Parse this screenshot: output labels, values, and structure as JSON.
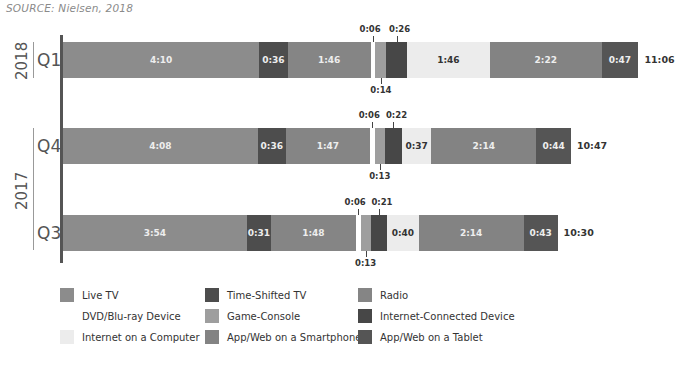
{
  "source": "SOURCE: Nielsen, 2018",
  "colors": {
    "live_tv": "#8c8c8c",
    "time_shifted_tv": "#4d4d4d",
    "radio": "#858585",
    "dvd": "#ffffff",
    "game_console": "#9e9e9e",
    "internet_connected": "#474747",
    "internet_computer": "#ececec",
    "smartphone": "#838383",
    "tablet": "#555555",
    "axis": "#555555"
  },
  "legend": [
    {
      "key": "live_tv",
      "label": "Live TV"
    },
    {
      "key": "time_shifted_tv",
      "label": "Time-Shifted TV"
    },
    {
      "key": "radio",
      "label": "Radio"
    },
    {
      "key": "dvd",
      "label": "DVD/Blu-ray Device"
    },
    {
      "key": "game_console",
      "label": "Game-Console"
    },
    {
      "key": "internet_connected",
      "label": "Internet-Connected Device"
    },
    {
      "key": "internet_computer",
      "label": "Internet on a Computer"
    },
    {
      "key": "smartphone",
      "label": "App/Web on a Smartphone"
    },
    {
      "key": "tablet",
      "label": "App/Web on a Tablet"
    }
  ],
  "rows": [
    {
      "year": "2018",
      "quarter": "Q1",
      "total": "11:06",
      "labels": [
        "4:10",
        "0:36",
        "1:46",
        "0:06",
        "0:14",
        "0:26",
        "1:46",
        "2:22",
        "0:47"
      ]
    },
    {
      "year": "2017",
      "quarter": "Q4",
      "total": "10:47",
      "labels": [
        "4:08",
        "0:36",
        "1:47",
        "0:06",
        "0:13",
        "0:22",
        "0:37",
        "2:14",
        "0:44"
      ]
    },
    {
      "year": "2017",
      "quarter": "Q3",
      "total": "10:30",
      "labels": [
        "3:54",
        "0:31",
        "1:48",
        "0:06",
        "0:13",
        "0:21",
        "0:40",
        "2:14",
        "0:43"
      ]
    }
  ],
  "chart_data": {
    "type": "bar",
    "orientation": "horizontal",
    "stacked": true,
    "title": "",
    "source": "SOURCE: Nielsen, 2018",
    "xlabel": "",
    "ylabel": "",
    "unit": "minutes per day (displayed as h:mm)",
    "categories": [
      "2018 Q1",
      "2017 Q4",
      "2017 Q3"
    ],
    "year_groups": [
      {
        "year": "2018",
        "quarters": [
          "Q1"
        ]
      },
      {
        "year": "2017",
        "quarters": [
          "Q4",
          "Q3"
        ]
      }
    ],
    "series": [
      {
        "name": "Live TV",
        "values": [
          250,
          248,
          234
        ],
        "labels": [
          "4:10",
          "4:08",
          "3:54"
        ]
      },
      {
        "name": "Time-Shifted TV",
        "values": [
          36,
          36,
          31
        ],
        "labels": [
          "0:36",
          "0:36",
          "0:31"
        ]
      },
      {
        "name": "Radio",
        "values": [
          106,
          107,
          108
        ],
        "labels": [
          "1:46",
          "1:47",
          "1:48"
        ]
      },
      {
        "name": "DVD/Blu-ray Device",
        "values": [
          6,
          6,
          6
        ],
        "labels": [
          "0:06",
          "0:06",
          "0:06"
        ]
      },
      {
        "name": "Game-Console",
        "values": [
          14,
          13,
          13
        ],
        "labels": [
          "0:14",
          "0:13",
          "0:13"
        ]
      },
      {
        "name": "Internet-Connected Device",
        "values": [
          26,
          22,
          21
        ],
        "labels": [
          "0:26",
          "0:22",
          "0:21"
        ]
      },
      {
        "name": "Internet on a Computer",
        "values": [
          106,
          37,
          40
        ],
        "labels": [
          "1:46",
          "0:37",
          "0:40"
        ]
      },
      {
        "name": "App/Web on a Smartphone",
        "values": [
          142,
          134,
          134
        ],
        "labels": [
          "2:22",
          "2:14",
          "2:14"
        ]
      },
      {
        "name": "App/Web on a Tablet",
        "values": [
          47,
          44,
          43
        ],
        "labels": [
          "0:47",
          "0:44",
          "0:43"
        ]
      }
    ],
    "totals": [
      {
        "category": "2018 Q1",
        "label": "11:06",
        "minutes": 666
      },
      {
        "category": "2017 Q4",
        "label": "10:47",
        "minutes": 647
      },
      {
        "category": "2017 Q3",
        "label": "10:30",
        "minutes": 630
      }
    ],
    "legend_position": "bottom",
    "grid": false
  }
}
